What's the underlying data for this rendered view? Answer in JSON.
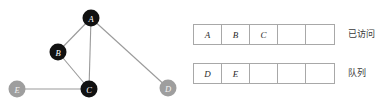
{
  "graph": {
    "edge_color": "#9a9a9a",
    "node_visited_color": "#111111",
    "node_unvisited_color": "#9e9e9e",
    "nodes": [
      {
        "id": "A",
        "label": "A",
        "x": 91,
        "y": 18,
        "r": 8.5,
        "state": "visited"
      },
      {
        "id": "B",
        "label": "B",
        "x": 58,
        "y": 52,
        "r": 8.5,
        "state": "visited"
      },
      {
        "id": "C",
        "label": "C",
        "x": 89,
        "y": 89,
        "r": 8.5,
        "state": "visited"
      },
      {
        "id": "D",
        "label": "D",
        "x": 168,
        "y": 88,
        "r": 8.5,
        "state": "unvisited"
      },
      {
        "id": "E",
        "label": "E",
        "x": 17,
        "y": 89,
        "r": 8.5,
        "state": "unvisited"
      }
    ],
    "edges": [
      {
        "from": "A",
        "to": "B"
      },
      {
        "from": "A",
        "to": "C"
      },
      {
        "from": "A",
        "to": "D"
      },
      {
        "from": "B",
        "to": "C"
      },
      {
        "from": "C",
        "to": "E"
      }
    ]
  },
  "arrays": {
    "visited": {
      "label": "已访问",
      "cells": [
        "A",
        "B",
        "C",
        "",
        ""
      ]
    },
    "queue": {
      "label": "队列",
      "cells": [
        "D",
        "E",
        "",
        "",
        ""
      ]
    }
  }
}
